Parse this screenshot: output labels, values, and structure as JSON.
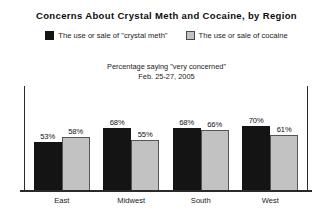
{
  "chart_data": {
    "type": "bar",
    "title": "Concerns About Crystal Meth and Cocaine, by Region",
    "subtitle_line1": "Percentage saying \"very concerned\"",
    "subtitle_line2": "Feb. 25-27, 2005",
    "xlabel": "",
    "ylabel": "",
    "ylim": [
      0,
      100
    ],
    "grid": false,
    "legend_position": "top-center",
    "categories": [
      "East",
      "Midwest",
      "South",
      "West"
    ],
    "series": [
      {
        "name": "The use or sale of \"crystal meth\"",
        "color": "#141414",
        "values": [
          53,
          68,
          68,
          70
        ],
        "labels": [
          "53%",
          "68%",
          "68%",
          "70%"
        ]
      },
      {
        "name": "The use or sale of cocaine",
        "color": "#c2c2c2",
        "values": [
          58,
          55,
          66,
          61
        ],
        "labels": [
          "58%",
          "55%",
          "66%",
          "61%"
        ]
      }
    ]
  },
  "legend": {
    "items": [
      {
        "label": "The use or sale of \"crystal meth\"",
        "swatch": "black-square-swatch"
      },
      {
        "label": "The use or sale of cocaine",
        "swatch": "gray-square-swatch"
      }
    ]
  }
}
